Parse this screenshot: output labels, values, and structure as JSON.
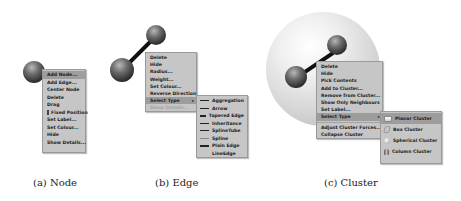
{
  "panels": {
    "node": {
      "caption": "(a) Node",
      "menu": [
        {
          "label": "Add Node...",
          "selected": true
        },
        {
          "label": "Add Edge..."
        },
        {
          "label": "Center Node"
        },
        {
          "label": "Delete"
        },
        {
          "label": "Drag"
        },
        {
          "label": "Fixed Position",
          "checkbox": true
        },
        {
          "label": "Set Label..."
        },
        {
          "label": "Set Colour..."
        },
        {
          "label": "Hide"
        },
        {
          "label": "Show Details..."
        }
      ]
    },
    "edge": {
      "caption": "(b) Edge",
      "menu": [
        {
          "label": "Delete"
        },
        {
          "label": "Hide"
        },
        {
          "label": "Radius..."
        },
        {
          "label": "Weight..."
        },
        {
          "label": "Set Colour..."
        },
        {
          "label": "Reverse Direction"
        },
        {
          "label": "Select Type",
          "selected": true,
          "submenu": true
        },
        {
          "label": "Show Details...",
          "disabled": true
        }
      ],
      "submenu": [
        {
          "label": "Aggregation",
          "icon": "aggregation-line-icon"
        },
        {
          "label": "Arrow",
          "icon": "arrow-line-icon"
        },
        {
          "label": "Tapered Edge",
          "icon": "tapered-line-icon"
        },
        {
          "label": "Inheritance",
          "icon": "inheritance-line-icon"
        },
        {
          "label": "SplineTube",
          "icon": "spline-tube-icon"
        },
        {
          "label": "Spline",
          "icon": "spline-line-icon"
        },
        {
          "label": "Plain Edge",
          "icon": "plain-line-icon"
        },
        {
          "label": "LineEdge",
          "icon": "line-edge-icon"
        }
      ]
    },
    "cluster": {
      "caption": "(c) Cluster",
      "menu": [
        {
          "label": "Delete"
        },
        {
          "label": "Hide"
        },
        {
          "label": "Pick Contents"
        },
        {
          "label": "Add to Cluster..."
        },
        {
          "label": "Remove from Cluster..."
        },
        {
          "label": "Show Only Neighbours"
        },
        {
          "label": "Set Label..."
        },
        {
          "label": "Select Type",
          "selected": true,
          "submenu": true
        },
        {
          "label": "Adjust Cluster Forces..."
        },
        {
          "label": "Collapse Cluster"
        }
      ],
      "submenu": [
        {
          "label": "Planar Cluster",
          "selected": true,
          "icon": "planar-cluster-icon"
        },
        {
          "label": "Box Cluster",
          "icon": "box-cluster-icon"
        },
        {
          "label": "Spherical Cluster",
          "icon": "spherical-cluster-icon"
        },
        {
          "label": "Column Cluster",
          "icon": "column-cluster-icon"
        }
      ]
    }
  },
  "submenu_arrow": "▸"
}
